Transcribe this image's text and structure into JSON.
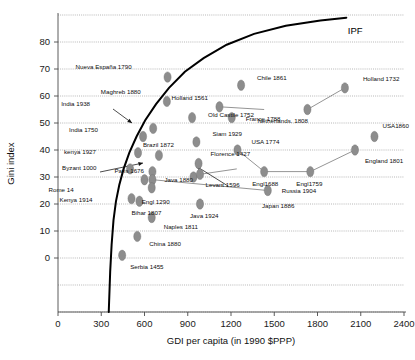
{
  "chart_data": {
    "type": "scatter",
    "title": "",
    "xlabel": "GDI per capita (in 1990 $PPP)",
    "ylabel": "Gini index",
    "xlim": [
      0,
      2400
    ],
    "ylim": [
      -20,
      90
    ],
    "xticks": [
      0,
      300,
      600,
      900,
      1200,
      1500,
      1800,
      2100,
      2400
    ],
    "yticks": [
      0,
      10,
      20,
      30,
      40,
      50,
      60,
      70,
      80
    ],
    "grid": true,
    "legend": "none",
    "annotations": [
      {
        "name": "ipf-curve-label",
        "text": "IPF",
        "x": 2010,
        "y": 84
      }
    ],
    "points": [
      {
        "label": "Nueva España 1790",
        "x": 760,
        "y": 67,
        "label_dx": -92,
        "label_dy": -8
      },
      {
        "label": "Maghreb 1880",
        "x": 755,
        "y": 58,
        "label_dx": -66,
        "label_dy": -7
      },
      {
        "label": "Chile 1861",
        "x": 1270,
        "y": 64,
        "label_dx": 16,
        "label_dy": -5
      },
      {
        "label": "Holland 1732",
        "x": 1990,
        "y": 63,
        "label_dx": 18,
        "label_dy": -7
      },
      {
        "label": "Holland 1561",
        "x": 1120,
        "y": 56,
        "label_dx": -48,
        "label_dy": -7
      },
      {
        "label": "Netherlands. 1808",
        "x": 1730,
        "y": 55,
        "label_dx": -50,
        "label_dy": 13
      },
      {
        "label": "France 1788",
        "x": 1205,
        "y": 52,
        "label_dx": 14,
        "label_dy": 3
      },
      {
        "label": "Old Castile 1752",
        "x": 930,
        "y": 52,
        "label_dx": 16,
        "label_dy": -1
      },
      {
        "label": "India 1938",
        "x": 660,
        "y": 48,
        "label_dx": -92,
        "label_dy": -22
      },
      {
        "label": "India 1750",
        "x": 590,
        "y": 45,
        "label_dx": -74,
        "label_dy": -5
      },
      {
        "label": "Siam 1929",
        "x": 960,
        "y": 43,
        "label_dx": 16,
        "label_dy": -6
      },
      {
        "label": "USA 1774",
        "x": 1245,
        "y": 40,
        "label_dx": 14,
        "label_dy": -6
      },
      {
        "label": "USA1860",
        "x": 2195,
        "y": 45,
        "label_dx": 8,
        "label_dy": -9
      },
      {
        "label": "England 1801",
        "x": 2060,
        "y": 40,
        "label_dx": 10,
        "label_dy": 13
      },
      {
        "label": "kenya 1927",
        "x": 555,
        "y": 39,
        "label_dx": -74,
        "label_dy": 1
      },
      {
        "label": "Brazil 1872",
        "x": 700,
        "y": 38,
        "label_dx": -16,
        "label_dy": -8
      },
      {
        "label": "Florence 1427",
        "x": 975,
        "y": 35,
        "label_dx": 12,
        "label_dy": -8
      },
      {
        "label": "Engl1688",
        "x": 1430,
        "y": 32,
        "label_dx": -12,
        "label_dy": 14
      },
      {
        "label": "Engl1759",
        "x": 1750,
        "y": 32,
        "label_dx": -14,
        "label_dy": 14
      },
      {
        "label": "Byzant 1000",
        "x": 500,
        "y": 33,
        "label_dx": -68,
        "label_dy": 1
      },
      {
        "label": "Paris 1676",
        "x": 655,
        "y": 32,
        "label_dx": -38,
        "label_dy": 1
      },
      {
        "label": "Java 1880",
        "x": 655,
        "y": 29,
        "label_dx": 12,
        "label_dy": 2
      },
      {
        "label": "Levant 1596",
        "x": 940,
        "y": 30,
        "label_dx": 12,
        "label_dy": 10
      },
      {
        "label": "Rome 14",
        "x": 600,
        "y": 29,
        "label_dx": -96,
        "label_dy": 12
      },
      {
        "label": "Engl 1290",
        "x": 650,
        "y": 26,
        "label_dx": -10,
        "label_dy": 16
      },
      {
        "label": "Russia 1904",
        "x": 1455,
        "y": 25,
        "label_dx": 14,
        "label_dy": 2
      },
      {
        "label": "Kenya 1914",
        "x": 510,
        "y": 22,
        "label_dx": -72,
        "label_dy": 3
      },
      {
        "label": "Bihar 1807",
        "x": 565,
        "y": 21,
        "label_dx": -8,
        "label_dy": 14
      },
      {
        "label": "Japan 1886",
        "x": 985,
        "y": 31,
        "label_dx": 62,
        "label_dy": 34
      },
      {
        "label": "Java 1924",
        "x": 985,
        "y": 20,
        "label_dx": -10,
        "label_dy": 14
      },
      {
        "label": "Naples 1811",
        "x": 650,
        "y": 15,
        "label_dx": 12,
        "label_dy": 11
      },
      {
        "label": "China 1880",
        "x": 550,
        "y": 8,
        "label_dx": 12,
        "label_dy": 10
      },
      {
        "label": "Serbia 1455",
        "x": 445,
        "y": 1,
        "label_dx": 8,
        "label_dy": 14
      }
    ],
    "connector_paths": [
      [
        [
          1430,
          32
        ],
        [
          1750,
          32
        ],
        [
          2060,
          40
        ]
      ],
      [
        [
          1730,
          55
        ],
        [
          1990,
          63
        ]
      ],
      [
        [
          1120,
          56
        ],
        [
          1430,
          55
        ]
      ],
      [
        [
          655,
          29
        ],
        [
          1455,
          25
        ]
      ],
      [
        [
          985,
          31
        ],
        [
          1240,
          33
        ]
      ],
      [
        [
          1245,
          40
        ],
        [
          1430,
          32
        ]
      ]
    ],
    "ipf_curve": [
      [
        352,
        -20
      ],
      [
        362,
        -5
      ],
      [
        372,
        5
      ],
      [
        385,
        14
      ],
      [
        402,
        21
      ],
      [
        425,
        27
      ],
      [
        455,
        33
      ],
      [
        495,
        39
      ],
      [
        545,
        45
      ],
      [
        605,
        51
      ],
      [
        680,
        57
      ],
      [
        770,
        63
      ],
      [
        880,
        69
      ],
      [
        1010,
        74
      ],
      [
        1170,
        79
      ],
      [
        1360,
        83
      ],
      [
        1580,
        86
      ],
      [
        1820,
        88
      ],
      [
        2000,
        89
      ]
    ]
  }
}
